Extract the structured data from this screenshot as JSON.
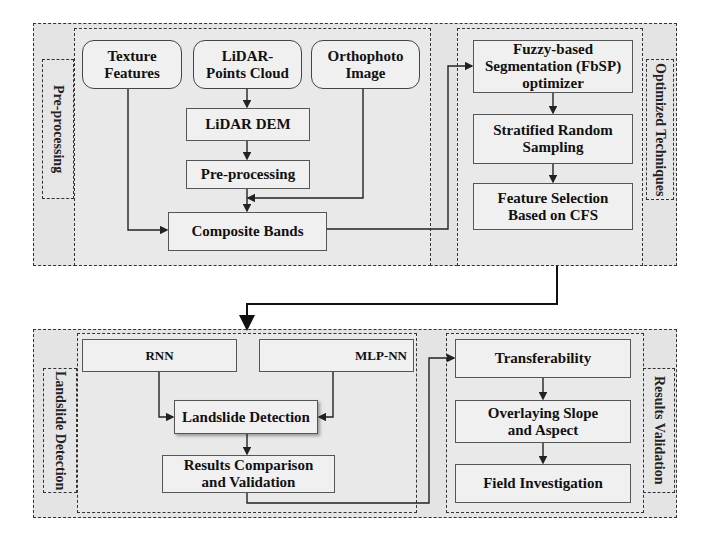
{
  "top_section": {
    "preprocessing": {
      "side_label": "Pre-processing",
      "inputs": [
        {
          "label": "Texture Features"
        },
        {
          "label": "LiDAR- Points Cloud"
        },
        {
          "label": "Orthophoto Image"
        }
      ],
      "lidar_dem": "LiDAR DEM",
      "preprocess_step": "Pre-processing",
      "composite": "Composite Bands"
    },
    "optimized": {
      "side_label": "Optimized Techniques",
      "steps": [
        {
          "label": "Fuzzy-based Segmentation (FbSP) optimizer"
        },
        {
          "label": "Stratified Random Sampling"
        },
        {
          "label": "Feature Selection Based on CFS"
        }
      ]
    }
  },
  "bottom_section": {
    "detection": {
      "side_label": "Landslide Detection",
      "models": [
        {
          "label": "RNN"
        },
        {
          "label": "MLP-NN"
        }
      ],
      "detection_step": "Landslide Detection",
      "comparison": "Results Comparison and Validation"
    },
    "validation": {
      "side_label": "Results Validation",
      "steps": [
        {
          "label": "Transferability"
        },
        {
          "label": "Overlaying Slope and Aspect"
        },
        {
          "label": "Field Investigation"
        }
      ]
    }
  }
}
